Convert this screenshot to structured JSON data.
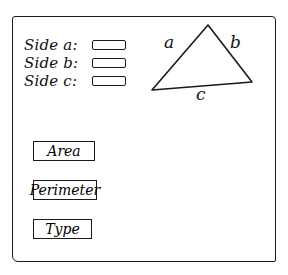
{
  "form": {
    "fields": [
      {
        "label": "Side a:",
        "value": "",
        "placeholder": ""
      },
      {
        "label": "Side b:",
        "value": "",
        "placeholder": ""
      },
      {
        "label": "Side c:",
        "value": "",
        "placeholder": ""
      }
    ]
  },
  "diagram": {
    "shape": "triangle",
    "side_labels": {
      "a": "a",
      "b": "b",
      "c": "c"
    }
  },
  "buttons": {
    "area": "Area",
    "perimeter": "Perimeter",
    "type": "Type"
  }
}
